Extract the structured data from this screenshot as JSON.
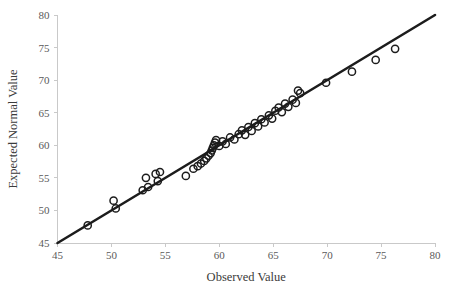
{
  "chart_data": {
    "type": "scatter",
    "title": "",
    "xlabel": "Observed Value",
    "ylabel": "Expected Normal Value",
    "xlim": [
      45,
      80
    ],
    "ylim": [
      45,
      80
    ],
    "xticks": [
      45,
      50,
      55,
      60,
      65,
      70,
      75,
      80
    ],
    "yticks": [
      45,
      50,
      55,
      60,
      65,
      70,
      75,
      80
    ],
    "grid": false,
    "legend": null,
    "marker_style": "open-circle",
    "reference_line": {
      "label": "identity-line",
      "x": [
        45,
        80
      ],
      "y": [
        45,
        80
      ],
      "color": "#1c1c1c"
    },
    "points": [
      {
        "x": 47.8,
        "y": 47.7
      },
      {
        "x": 50.2,
        "y": 51.5
      },
      {
        "x": 50.4,
        "y": 50.3
      },
      {
        "x": 52.9,
        "y": 53.1
      },
      {
        "x": 53.2,
        "y": 55.0
      },
      {
        "x": 53.4,
        "y": 53.6
      },
      {
        "x": 54.1,
        "y": 55.6
      },
      {
        "x": 54.3,
        "y": 54.5
      },
      {
        "x": 54.5,
        "y": 55.9
      },
      {
        "x": 56.9,
        "y": 55.3
      },
      {
        "x": 57.6,
        "y": 56.4
      },
      {
        "x": 58.0,
        "y": 56.8
      },
      {
        "x": 58.3,
        "y": 57.2
      },
      {
        "x": 58.6,
        "y": 57.6
      },
      {
        "x": 58.8,
        "y": 58.0
      },
      {
        "x": 59.0,
        "y": 58.4
      },
      {
        "x": 59.2,
        "y": 58.8
      },
      {
        "x": 59.3,
        "y": 59.2
      },
      {
        "x": 59.4,
        "y": 59.6
      },
      {
        "x": 59.5,
        "y": 60.0
      },
      {
        "x": 59.6,
        "y": 60.4
      },
      {
        "x": 59.7,
        "y": 60.8
      },
      {
        "x": 60.0,
        "y": 59.9
      },
      {
        "x": 60.3,
        "y": 60.6
      },
      {
        "x": 60.6,
        "y": 60.2
      },
      {
        "x": 61.0,
        "y": 61.2
      },
      {
        "x": 61.4,
        "y": 60.9
      },
      {
        "x": 61.8,
        "y": 61.7
      },
      {
        "x": 62.1,
        "y": 62.3
      },
      {
        "x": 62.4,
        "y": 61.6
      },
      {
        "x": 62.7,
        "y": 62.8
      },
      {
        "x": 63.0,
        "y": 62.2
      },
      {
        "x": 63.3,
        "y": 63.4
      },
      {
        "x": 63.6,
        "y": 62.9
      },
      {
        "x": 63.9,
        "y": 64.0
      },
      {
        "x": 64.2,
        "y": 63.5
      },
      {
        "x": 64.6,
        "y": 64.6
      },
      {
        "x": 64.9,
        "y": 64.1
      },
      {
        "x": 65.2,
        "y": 65.3
      },
      {
        "x": 65.5,
        "y": 65.8
      },
      {
        "x": 65.8,
        "y": 65.1
      },
      {
        "x": 66.1,
        "y": 66.4
      },
      {
        "x": 66.4,
        "y": 65.9
      },
      {
        "x": 66.8,
        "y": 67.0
      },
      {
        "x": 67.1,
        "y": 66.5
      },
      {
        "x": 67.3,
        "y": 68.4
      },
      {
        "x": 67.5,
        "y": 68.0
      },
      {
        "x": 69.9,
        "y": 69.6
      },
      {
        "x": 72.3,
        "y": 71.3
      },
      {
        "x": 74.5,
        "y": 73.1
      },
      {
        "x": 76.3,
        "y": 74.8
      }
    ]
  }
}
